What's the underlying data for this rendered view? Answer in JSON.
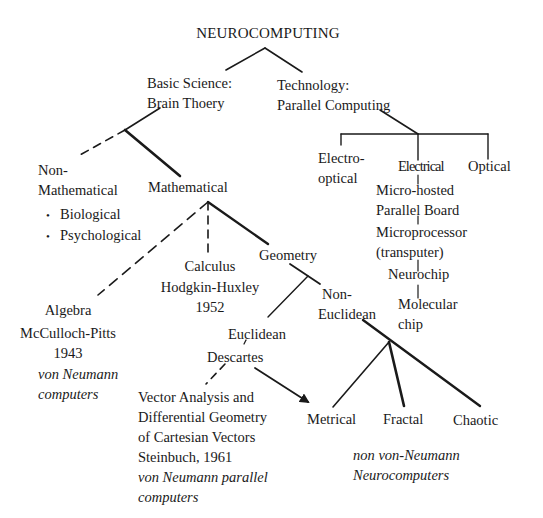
{
  "root": {
    "label": "NEUROCOMPUTING"
  },
  "level1": {
    "science": {
      "line1": "Basic Science:",
      "line2": "Brain Thoery"
    },
    "technology": {
      "line1": "Technology:",
      "line2": "Parallel Computing"
    }
  },
  "science_branch": {
    "non_mathematical": {
      "line1": "Non-",
      "line2": "Mathematical",
      "bullets": [
        "Biological",
        "Psychological"
      ]
    },
    "mathematical": {
      "label": "Mathematical"
    },
    "algebra": {
      "line1": "Algebra",
      "line2": "McCulloch-Pitts",
      "line3": "1943",
      "note1": "von Neumann",
      "note2": "computers"
    },
    "calculus": {
      "line1": "Calculus",
      "line2": "Hodgkin-Huxley",
      "line3": "1952"
    },
    "geometry": {
      "label": "Geometry"
    },
    "euclidean": {
      "line1": "Euclidean",
      "line2": "Descartes"
    },
    "non_euclidean": {
      "line1": "Non-",
      "line2": "Euclidean"
    },
    "vector_analysis": {
      "line1": "Vector Analysis and",
      "line2": "Differential Geometry",
      "line3": "of Cartesian Vectors",
      "line4": "Steinbuch, 1961",
      "note1": "von Neumann parallel",
      "note2": "computers"
    },
    "metrical": {
      "label": "Metrical"
    },
    "fractal": {
      "label": "Fractal"
    },
    "chaotic": {
      "label": "Chaotic"
    },
    "neuro_note": {
      "line1": "non von-Neumann",
      "line2": "Neurocomputers"
    }
  },
  "technology_branch": {
    "electro_optical": {
      "line1": "Electro-",
      "line2": "optical"
    },
    "electrical": {
      "label": "Electrical"
    },
    "optical": {
      "label": "Optical"
    },
    "chain": [
      {
        "line1": "Micro-hosted",
        "line2": "Parallel Board"
      },
      {
        "line1": "Microprocessor",
        "line2": "(transputer)"
      },
      {
        "line1": "Neurochip"
      },
      {
        "line1": "Molecular",
        "line2": "chip"
      }
    ]
  },
  "legend": {
    "solid_thin": "branch",
    "solid_thick": "main path",
    "dashed": "alternative path",
    "arrow": "leads to"
  },
  "colors": {
    "ink": "#1a1a1a",
    "background": "#ffffff"
  }
}
